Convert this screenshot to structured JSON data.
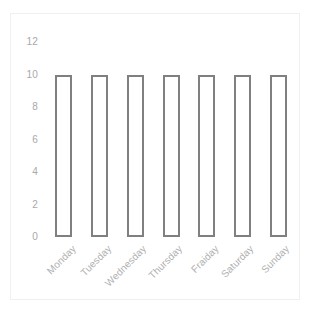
{
  "chart_data": {
    "type": "bar",
    "title": "",
    "subtitle": "",
    "xlabel": "",
    "ylabel": "",
    "categories": [
      "Monday",
      "Tuesday",
      "Wednesday",
      "Thursday",
      "Fraiday",
      "Saturday",
      "Sunday"
    ],
    "values": [
      10,
      10,
      10,
      10,
      10,
      10,
      10
    ],
    "ylim": [
      0,
      12
    ],
    "yticks": [
      0,
      2,
      4,
      6,
      8,
      10,
      12
    ],
    "ytick_labels": [
      "0",
      "2",
      "4",
      "6",
      "8",
      "10",
      "12"
    ],
    "grid": false,
    "legend": null,
    "legend_position": "none",
    "annotations": [],
    "series": [
      {
        "name": "",
        "values": [
          10,
          10,
          10,
          10,
          10,
          10,
          10
        ]
      }
    ]
  },
  "style": {
    "bar_fill": "#ffffff",
    "bar_outline": "#808080",
    "bar_outline_width_px": 2,
    "tick_label_color": "#a8a8a8",
    "category_label_color": "#b0b0b0",
    "frame_color": "#f0f0f0",
    "background": "#ffffff",
    "category_label_rotation_deg": -45
  }
}
